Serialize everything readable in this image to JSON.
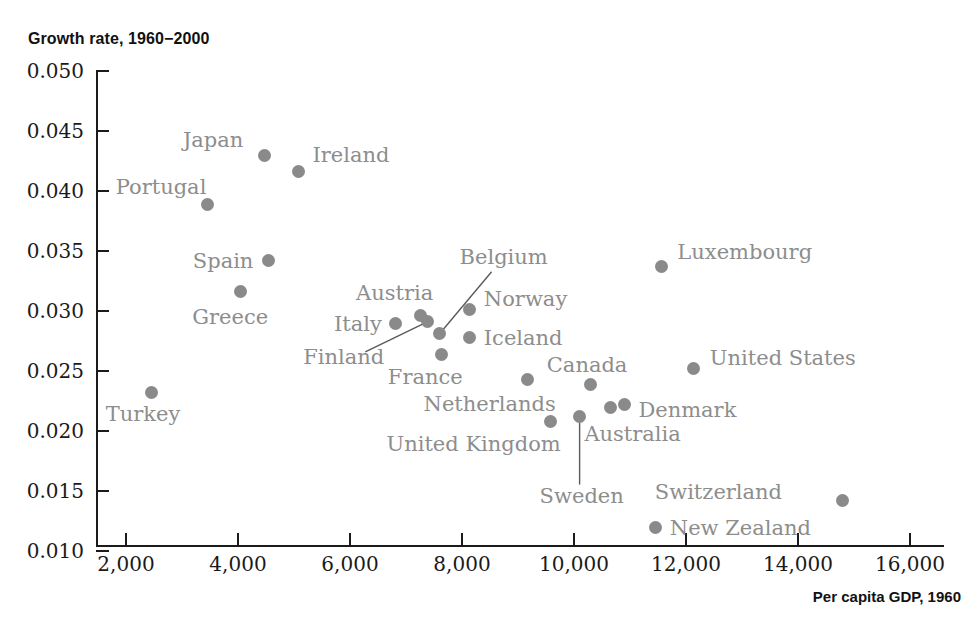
{
  "chart_data": {
    "type": "scatter",
    "title": "",
    "ylabel": "Growth rate, 1960−2000",
    "xlabel": "Per capita GDP, 1960",
    "xlim": [
      1000,
      16500
    ],
    "ylim": [
      0.01,
      0.05
    ],
    "grid": false,
    "legend": "none",
    "point_color": "#8a8a8a",
    "xticks": [
      "2,000",
      "4,000",
      "6,000",
      "8,000",
      "10,000",
      "12,000",
      "14,000",
      "16,000"
    ],
    "xtick_values": [
      2000,
      4000,
      6000,
      8000,
      10000,
      12000,
      14000,
      16000
    ],
    "yticks": [
      "0.050",
      "0.045",
      "0.040",
      "0.035",
      "0.030",
      "0.025",
      "0.020",
      "0.015",
      "0.010"
    ],
    "ytick_values": [
      0.05,
      0.045,
      0.04,
      0.035,
      0.03,
      0.025,
      0.02,
      0.015,
      0.01
    ],
    "points": [
      {
        "name": "Turkey",
        "x": 2460,
        "y": 0.0232,
        "label_dx": -46,
        "label_dy": 22,
        "leader": false
      },
      {
        "name": "Portugal",
        "x": 3460,
        "y": 0.0389,
        "label_dx": -92,
        "label_dy": -16,
        "leader": false
      },
      {
        "name": "Greece",
        "x": 4040,
        "y": 0.0316,
        "label_dx": -48,
        "label_dy": 26,
        "leader": false
      },
      {
        "name": "Japan",
        "x": 4480,
        "y": 0.043,
        "label_dx": -82,
        "label_dy": -14,
        "leader": false
      },
      {
        "name": "Spain",
        "x": 4550,
        "y": 0.0342,
        "label_dx": -76,
        "label_dy": 1,
        "leader": false
      },
      {
        "name": "Ireland",
        "x": 5080,
        "y": 0.0416,
        "label_dx": 14,
        "label_dy": -16,
        "leader": false
      },
      {
        "name": "Italy",
        "x": 6820,
        "y": 0.029,
        "label_dx": -62,
        "label_dy": 2,
        "leader": false
      },
      {
        "name": "Austria",
        "x": 7250,
        "y": 0.0296,
        "label_dx": -64,
        "label_dy": -22,
        "leader": false
      },
      {
        "name": "Finland",
        "x": 7380,
        "y": 0.0291,
        "label_dx": -124,
        "label_dy": 36,
        "leader": true,
        "lx": -62,
        "ly": 30
      },
      {
        "name": "Belgium",
        "x": 7600,
        "y": 0.0281,
        "label_dx": 20,
        "label_dy": -76,
        "leader": true,
        "lx": 52,
        "ly": -62
      },
      {
        "name": "France",
        "x": 7640,
        "y": 0.0264,
        "label_dx": -54,
        "label_dy": 24,
        "leader": false
      },
      {
        "name": "Norway",
        "x": 8140,
        "y": 0.0301,
        "label_dx": 14,
        "label_dy": -10,
        "leader": false
      },
      {
        "name": "Iceland",
        "x": 8140,
        "y": 0.0278,
        "label_dx": 14,
        "label_dy": 2,
        "leader": false
      },
      {
        "name": "Netherlands",
        "x": 9170,
        "y": 0.0243,
        "label_dx": -104,
        "label_dy": 26,
        "leader": false
      },
      {
        "name": "United Kingdom",
        "x": 9580,
        "y": 0.0208,
        "label_dx": -164,
        "label_dy": 24,
        "leader": false
      },
      {
        "name": "Sweden",
        "x": 10100,
        "y": 0.0212,
        "label_dx": -40,
        "label_dy": 80,
        "leader": true,
        "lx": 0,
        "ly": 68
      },
      {
        "name": "Canada",
        "x": 10300,
        "y": 0.0239,
        "label_dx": -44,
        "label_dy": -18,
        "leader": false
      },
      {
        "name": "Australia",
        "x": 10650,
        "y": 0.022,
        "label_dx": -26,
        "label_dy": 28,
        "leader": false
      },
      {
        "name": "Denmark",
        "x": 10900,
        "y": 0.0222,
        "label_dx": 14,
        "label_dy": 6,
        "leader": false
      },
      {
        "name": "New Zealand",
        "x": 11460,
        "y": 0.012,
        "label_dx": 14,
        "label_dy": 2,
        "leader": false
      },
      {
        "name": "Luxembourg",
        "x": 11560,
        "y": 0.0337,
        "label_dx": 16,
        "label_dy": -14,
        "leader": false
      },
      {
        "name": "United States",
        "x": 12140,
        "y": 0.0252,
        "label_dx": 16,
        "label_dy": -10,
        "leader": false
      },
      {
        "name": "Switzerland",
        "x": 14800,
        "y": 0.0142,
        "label_dx": -188,
        "label_dy": -8,
        "leader": false
      }
    ]
  }
}
